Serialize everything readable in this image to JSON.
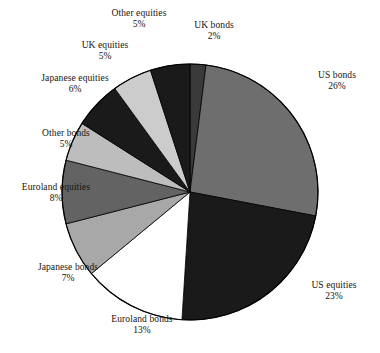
{
  "chart_data": {
    "type": "pie",
    "title": "",
    "legend_position": "callout-labels",
    "start_angle_deg": 0,
    "direction": "clockwise",
    "units": "percent",
    "categories": [
      "UK bonds",
      "US bonds",
      "US equities",
      "Euroland bonds",
      "Japanese bonds",
      "Euroland equities",
      "Other bonds",
      "Japanese equities",
      "UK equities",
      "Other equities"
    ],
    "values": [
      2,
      26,
      23,
      13,
      7,
      8,
      5,
      6,
      5,
      5
    ],
    "slices": [
      {
        "label": "UK bonds",
        "value": 2,
        "value_text": "2%",
        "color": "#3a3a3a"
      },
      {
        "label": "US bonds",
        "value": 26,
        "value_text": "26%",
        "color": "#6e6e6e"
      },
      {
        "label": "US equities",
        "value": 23,
        "value_text": "23%",
        "color": "#1a1a1a"
      },
      {
        "label": "Euroland bonds",
        "value": 13,
        "value_text": "13%",
        "color": "#ffffff"
      },
      {
        "label": "Japanese bonds",
        "value": 7,
        "value_text": "7%",
        "color": "#a8a8a8"
      },
      {
        "label": "Euroland equities",
        "value": 8,
        "value_text": "8%",
        "color": "#636363"
      },
      {
        "label": "Other bonds",
        "value": 5,
        "value_text": "5%",
        "color": "#bdbdbd"
      },
      {
        "label": "Japanese equities",
        "value": 6,
        "value_text": "6%",
        "color": "#1a1a1a"
      },
      {
        "label": "UK equities",
        "value": 5,
        "value_text": "5%",
        "color": "#cccccc"
      },
      {
        "label": "Other equities",
        "value": 5,
        "value_text": "5%",
        "color": "#1a1a1a"
      }
    ],
    "outline_color": "#000000",
    "background_color": "#ffffff"
  },
  "labels": {
    "other_equities": {
      "name": "Other equities",
      "value": "5%"
    },
    "uk_bonds": {
      "name": "UK bonds",
      "value": "2%"
    },
    "uk_equities": {
      "name": "UK equities",
      "value": "5%"
    },
    "japanese_equities": {
      "name": "Japanese equities",
      "value": "6%"
    },
    "other_bonds": {
      "name": "Other bonds",
      "value": "5%"
    },
    "euroland_equities": {
      "name": "Euroland equities",
      "value": "8%"
    },
    "japanese_bonds": {
      "name": "Japanese bonds",
      "value": "7%"
    },
    "euroland_bonds": {
      "name": "Euroland bonds",
      "value": "13%"
    },
    "us_equities": {
      "name": "US equities",
      "value": "23%"
    },
    "us_bonds": {
      "name": "US bonds",
      "value": "26%"
    }
  }
}
